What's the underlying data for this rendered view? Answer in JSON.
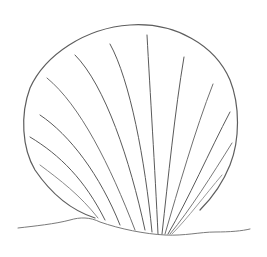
{
  "image": {
    "subject": "pencil sketch of a scallop seashell resting on sand",
    "style": "graphite line drawing on white paper",
    "background_color": "#ffffff",
    "line_color": "#5a5a5a",
    "light_line_color": "#9a9a9a",
    "elements": [
      {
        "name": "shell-outline",
        "description": "rounded fan-shaped scallop shell outline"
      },
      {
        "name": "shell-ribs",
        "description": "radiating rib lines converging at the hinge near bottom center",
        "count": 12
      },
      {
        "name": "sand-line",
        "description": "wavy ground line beneath the shell"
      }
    ]
  }
}
